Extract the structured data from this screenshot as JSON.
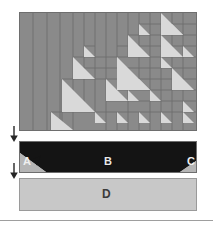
{
  "figure": {
    "title": "",
    "canvas": {
      "width": 213,
      "height": 225,
      "background": "#ffffff"
    }
  },
  "colors": {
    "pattern_fill": "#8a8a8a",
    "pattern_triangle": "#d9d9d9",
    "pattern_border": "#6e6e6e",
    "bar_b_dark": "#141414",
    "bar_background": "#c8c8c8",
    "bar_d_fill": "#c8c8c8",
    "bar_d_border": "#9a9a9a",
    "label_light": "#e8e8e8",
    "label_dark": "#3b3b3b",
    "arrow": "#262626",
    "rule": "#9e9e9e"
  },
  "panels": {
    "pattern": {
      "name": "recursive-triangle-subdivision",
      "x": 19,
      "y": 12,
      "width": 178,
      "height": 119,
      "description": "Gray field subdivided into vertical strips on the left and a recursive quadtree of right-triangles toward the right and bottom"
    },
    "bar_b": {
      "name": "trapezoid-bar",
      "x": 19,
      "y": 141,
      "width": 178,
      "height": 32,
      "description": "Dark trapezoid spanning the bar with light triangular wedges at the lower-left and lower-right"
    },
    "bar_d": {
      "name": "flat-bar",
      "x": 19,
      "y": 178,
      "width": 178,
      "height": 33,
      "description": "Uniform light gray rectangle"
    }
  },
  "labels": {
    "a": "A",
    "b": "B",
    "c": "C",
    "d": "D"
  },
  "arrows": [
    {
      "name": "arrow-step-1",
      "direction": "down",
      "x": 8,
      "y": 126
    },
    {
      "name": "arrow-step-2",
      "direction": "down",
      "x": 8,
      "y": 163
    }
  ],
  "pattern_geometry": {
    "vertical_strips_x": [
      0,
      13,
      27,
      40,
      53,
      66,
      76
    ],
    "cell_unit": 11.2,
    "triangles": [
      {
        "x": 141,
        "y": 0,
        "s": 22,
        "dir": "bl"
      },
      {
        "x": 119,
        "y": 11,
        "s": 11,
        "dir": "bl"
      },
      {
        "x": 152,
        "y": 11,
        "s": 11,
        "dir": "bl"
      },
      {
        "x": 108,
        "y": 22,
        "s": 22,
        "dir": "bl"
      },
      {
        "x": 141,
        "y": 22,
        "s": 22,
        "dir": "bl"
      },
      {
        "x": 163,
        "y": 33,
        "s": 11,
        "dir": "bl"
      },
      {
        "x": 64,
        "y": 33,
        "s": 11,
        "dir": "bl"
      },
      {
        "x": 97,
        "y": 44,
        "s": 33,
        "dir": "bl"
      },
      {
        "x": 53,
        "y": 44,
        "s": 22,
        "dir": "bl"
      },
      {
        "x": 141,
        "y": 44,
        "s": 11,
        "dir": "bl"
      },
      {
        "x": 152,
        "y": 55,
        "s": 22,
        "dir": "bl"
      },
      {
        "x": 42,
        "y": 66,
        "s": 33,
        "dir": "bl"
      },
      {
        "x": 86,
        "y": 66,
        "s": 22,
        "dir": "bl"
      },
      {
        "x": 119,
        "y": 66,
        "s": 11,
        "dir": "bl"
      },
      {
        "x": 108,
        "y": 77,
        "s": 11,
        "dir": "bl"
      },
      {
        "x": 130,
        "y": 77,
        "s": 11,
        "dir": "bl"
      },
      {
        "x": 163,
        "y": 88,
        "s": 22,
        "dir": "bl"
      },
      {
        "x": 31,
        "y": 99,
        "s": 22,
        "dir": "bl"
      },
      {
        "x": 75,
        "y": 99,
        "s": 11,
        "dir": "bl"
      },
      {
        "x": 97,
        "y": 99,
        "s": 11,
        "dir": "bl"
      },
      {
        "x": 119,
        "y": 99,
        "s": 11,
        "dir": "bl"
      },
      {
        "x": 141,
        "y": 99,
        "s": 11,
        "dir": "bl"
      }
    ]
  }
}
